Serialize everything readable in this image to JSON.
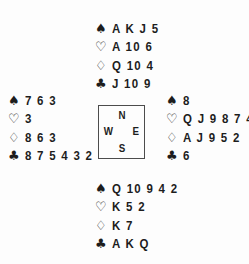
{
  "suits": {
    "spade": "♠",
    "heart": "♡",
    "diamond": "♢",
    "club": "♣"
  },
  "compass": {
    "north": "N",
    "east": "E",
    "south": "S",
    "west": "W"
  },
  "hands": {
    "north": {
      "spades": "A K J 5",
      "hearts": "A 10 6",
      "diamonds": "Q 10 4",
      "clubs": "J 10 9"
    },
    "west": {
      "spades": "7 6 3",
      "hearts": "3",
      "diamonds": "8 6 3",
      "clubs": "8 7 5 4 3 2"
    },
    "east": {
      "spades": "8",
      "hearts": "Q J 9 8 7 4",
      "diamonds": "A J 9 5 2",
      "clubs": "6"
    },
    "south": {
      "spades": "Q 10 9 4 2",
      "hearts": "K 5 2",
      "diamonds": "K 7",
      "clubs": "A K Q"
    }
  },
  "colors": {
    "text": "#1d1d1d",
    "background": "#fdfdfd",
    "box_border": "#4c4c4c"
  }
}
